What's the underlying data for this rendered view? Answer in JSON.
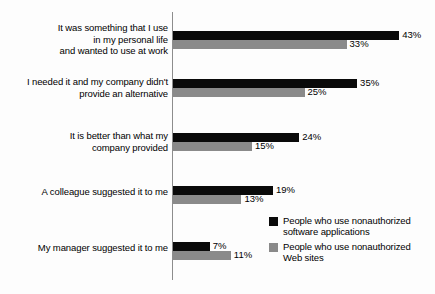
{
  "chart_data": {
    "type": "bar",
    "orientation": "horizontal",
    "title": "",
    "subtitle": "",
    "xlabel": "",
    "ylabel": "",
    "xlim": [
      0,
      50
    ],
    "grid": false,
    "legend_position": "inside-bottom-right",
    "axis_line": "vertical category axis at left of bars",
    "value_suffix": "%",
    "categories": [
      "It was something that I use\nin my personal life\nand wanted to use at work",
      "I needed it and my company didn't\nprovide an alternative",
      "It is better than what my\ncompany provided",
      "A colleague suggested it to me",
      "My manager suggested it to me"
    ],
    "series": [
      {
        "name": "People who use nonauthorized software applications",
        "color": "#0a0a0a",
        "values": [
          43,
          35,
          24,
          19,
          7
        ],
        "labels": [
          "43%",
          "35%",
          "24%",
          "19%",
          "7%"
        ]
      },
      {
        "name": "People who use nonauthorized Web sites",
        "color": "#8a8a8a",
        "values": [
          33,
          25,
          15,
          13,
          11
        ],
        "labels": [
          "33%",
          "25%",
          "15%",
          "13%",
          "11%"
        ]
      }
    ]
  },
  "groups": [
    {
      "label_lines": [
        "It was something that I use",
        "in my personal life",
        "and wanted to use at work"
      ],
      "top": 18,
      "label_top": 22,
      "bars_top": 31,
      "bars": [
        {
          "series": 0,
          "value": 43,
          "label": "43%"
        },
        {
          "series": 1,
          "value": 33,
          "label": "33%"
        }
      ]
    },
    {
      "label_lines": [
        "I needed it and my company didn't",
        "provide an alternative"
      ],
      "top": 72,
      "label_top": 76,
      "bars_top": 79,
      "bars": [
        {
          "series": 0,
          "value": 35,
          "label": "35%"
        },
        {
          "series": 1,
          "value": 25,
          "label": "25%"
        }
      ]
    },
    {
      "label_lines": [
        "It is better than what my",
        "company provided"
      ],
      "top": 126,
      "label_top": 130,
      "bars_top": 133,
      "bars": [
        {
          "series": 0,
          "value": 24,
          "label": "24%"
        },
        {
          "series": 1,
          "value": 15,
          "label": "15%"
        }
      ]
    },
    {
      "label_lines": [
        "A colleague suggested it to me"
      ],
      "top": 184,
      "label_top": 186,
      "bars_top": 186,
      "bars": [
        {
          "series": 0,
          "value": 19,
          "label": "19%"
        },
        {
          "series": 1,
          "value": 13,
          "label": "13%"
        }
      ]
    },
    {
      "label_lines": [
        "My manager suggested it to me"
      ],
      "top": 240,
      "label_top": 242,
      "bars_top": 242,
      "bars": [
        {
          "series": 0,
          "value": 7,
          "label": "7%"
        },
        {
          "series": 1,
          "value": 11,
          "label": "11%"
        }
      ]
    }
  ],
  "legend": {
    "items": [
      {
        "color": "#0a0a0a",
        "lines": [
          "People who use nonauthorized",
          "software applications"
        ]
      },
      {
        "color": "#8a8a8a",
        "lines": [
          "People who use nonauthorized",
          "Web sites"
        ]
      }
    ]
  },
  "scale": {
    "px_per_percent": 5.26,
    "origin_x": 173
  }
}
